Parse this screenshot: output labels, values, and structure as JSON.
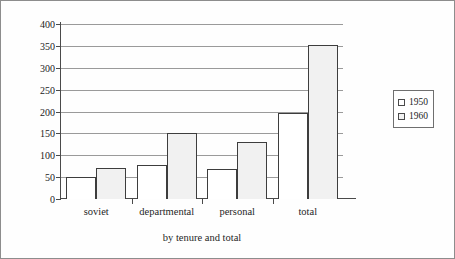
{
  "chart_data": {
    "type": "bar",
    "title": "",
    "xlabel": "by tenure and total",
    "ylabel": "housing space, 000,000 m²",
    "ylabel_main": "housing space, 000,000 m",
    "ylabel_sup": "2",
    "categories": [
      "soviet",
      "departmental",
      "personal",
      "total"
    ],
    "series": [
      {
        "name": "1950",
        "values": [
          51,
          77,
          68,
          196
        ]
      },
      {
        "name": "1960",
        "values": [
          72,
          150,
          131,
          353
        ]
      }
    ],
    "ylim": [
      0,
      400
    ],
    "ytick_labels": [
      "400",
      "350",
      "300",
      "250",
      "200",
      "150",
      "100",
      "50",
      "0"
    ],
    "ytick_values": [
      400,
      350,
      300,
      250,
      200,
      150,
      100,
      50,
      0
    ],
    "grid": true,
    "legend_position": "right",
    "legend_entries": [
      "1950",
      "1960"
    ],
    "colors": {
      "series_1950": "#ffffff",
      "series_1960": "#f1f1f1",
      "bar_outline": "#3d3d3d",
      "gridline": "#9a9a9a",
      "axis": "#4a4a4a",
      "text": "#1f1f1f",
      "background": "#fefefe",
      "border": "#8d8d8d"
    }
  }
}
